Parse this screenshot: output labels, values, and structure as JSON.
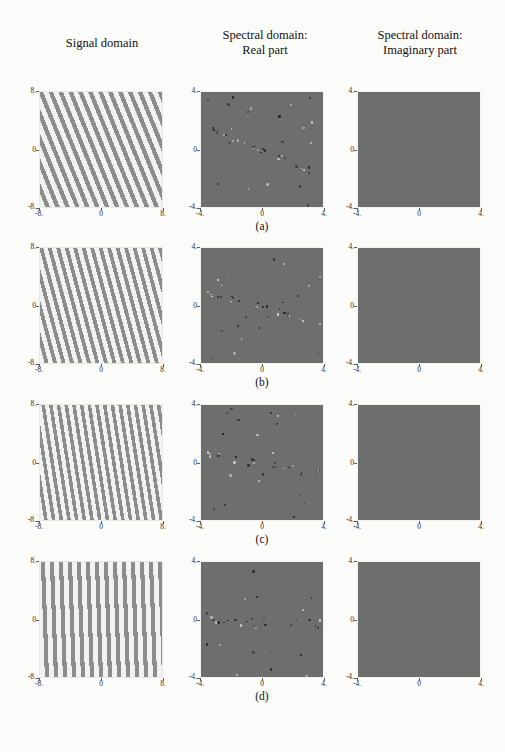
{
  "figure": {
    "columns": [
      {
        "id": "signal",
        "title_line1": "Signal domain",
        "title_line2": ""
      },
      {
        "id": "real",
        "title_line1": "Spectral domain:",
        "title_line2": "Real part"
      },
      {
        "id": "imag",
        "title_line1": "Spectral domain:",
        "title_line2": "Imaginary part"
      }
    ],
    "row_captions": [
      "(a)",
      "(b)",
      "(c)",
      "(d)"
    ]
  },
  "axes": {
    "signal": {
      "x_ticks": [
        "-8.",
        "0",
        "8."
      ],
      "y_ticks": [
        "8.",
        "0",
        "-8."
      ],
      "xlim": [
        -8,
        8
      ],
      "ylim": [
        -8,
        8
      ]
    },
    "spectral": {
      "x_ticks": [
        "-4.",
        "0",
        "4."
      ],
      "y_ticks": [
        "4.",
        "0",
        "-4."
      ],
      "xlim": [
        -4,
        4
      ],
      "ylim": [
        -4,
        4
      ]
    }
  },
  "chart_data": {
    "type": "heatmap",
    "xlabel": "",
    "ylabel": "",
    "grid": false,
    "legend": null,
    "panels": [
      {
        "row": "(a)",
        "signal": {
          "kind": "tilted-grating",
          "tilt_deg": 22,
          "period_px": 9.2,
          "stripe_color": "#8c8c8c",
          "background_color": "#f2f2f2",
          "xlim": [
            -8,
            8
          ],
          "ylim": [
            -8,
            8
          ]
        },
        "real": {
          "kind": "speckle-spectrum",
          "background_gray": "#6e6e6e",
          "impulse_axis_angle_deg": 22,
          "n_impulses": 46,
          "xlim": [
            -4,
            4
          ],
          "ylim": [
            -4,
            4
          ]
        },
        "imag": {
          "kind": "flat",
          "background_gray": "#6e6e6e",
          "xlim": [
            -4,
            4
          ],
          "ylim": [
            -4,
            4
          ]
        }
      },
      {
        "row": "(b)",
        "signal": {
          "kind": "tilted-grating",
          "tilt_deg": 15,
          "period_px": 8.2,
          "stripe_color": "#8c8c8c",
          "background_color": "#f2f2f2",
          "xlim": [
            -8,
            8
          ],
          "ylim": [
            -8,
            8
          ]
        },
        "real": {
          "kind": "speckle-spectrum",
          "background_gray": "#6e6e6e",
          "impulse_axis_angle_deg": 15,
          "n_impulses": 44,
          "xlim": [
            -4,
            4
          ],
          "ylim": [
            -4,
            4
          ]
        },
        "imag": {
          "kind": "flat",
          "background_gray": "#6e6e6e",
          "xlim": [
            -4,
            4
          ],
          "ylim": [
            -4,
            4
          ]
        }
      },
      {
        "row": "(c)",
        "signal": {
          "kind": "tilted-grating",
          "tilt_deg": 9,
          "period_px": 7.6,
          "stripe_color": "#8c8c8c",
          "background_color": "#f2f2f2",
          "xlim": [
            -8,
            8
          ],
          "ylim": [
            -8,
            8
          ]
        },
        "real": {
          "kind": "speckle-spectrum",
          "background_gray": "#6e6e6e",
          "impulse_axis_angle_deg": 9,
          "n_impulses": 42,
          "xlim": [
            -4,
            4
          ],
          "ylim": [
            -4,
            4
          ]
        },
        "imag": {
          "kind": "flat",
          "background_gray": "#6e6e6e",
          "xlim": [
            -4,
            4
          ],
          "ylim": [
            -4,
            4
          ]
        }
      },
      {
        "row": "(d)",
        "signal": {
          "kind": "tilted-grating",
          "tilt_deg": 2,
          "period_px": 9.0,
          "stripe_color": "#8c8c8c",
          "background_color": "#f2f2f2",
          "xlim": [
            -8,
            8
          ],
          "ylim": [
            -8,
            8
          ]
        },
        "real": {
          "kind": "speckle-spectrum",
          "background_gray": "#6e6e6e",
          "impulse_axis_angle_deg": 2,
          "n_impulses": 40,
          "xlim": [
            -4,
            4
          ],
          "ylim": [
            -4,
            4
          ]
        },
        "imag": {
          "kind": "flat",
          "background_gray": "#6e6e6e",
          "xlim": [
            -4,
            4
          ],
          "ylim": [
            -4,
            4
          ]
        }
      }
    ]
  }
}
